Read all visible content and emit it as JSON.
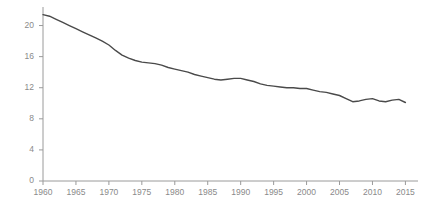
{
  "chart_data": {
    "type": "line",
    "title": "",
    "subtitle": "",
    "xlabel": "",
    "ylabel": "",
    "xlim": [
      1960,
      2016
    ],
    "ylim": [
      0,
      22
    ],
    "grid": false,
    "legend": null,
    "line_color": "#4a4a4a",
    "axis_color": "#9a9a9a",
    "tick_label_color": "#8a8a8a",
    "yticks": [
      0,
      4,
      8,
      12,
      16,
      20
    ],
    "ytick_labels": [
      "0",
      "4",
      "8",
      "12",
      "16",
      "20"
    ],
    "xticks": [
      1960,
      1965,
      1970,
      1975,
      1980,
      1985,
      1990,
      1995,
      2000,
      2005,
      2010,
      2015
    ],
    "xtick_labels": [
      "1960",
      "1965",
      "1970",
      "1975",
      "1980",
      "1985",
      "1990",
      "1995",
      "2000",
      "2005",
      "2010",
      "2015"
    ],
    "series": [
      {
        "name": "rate",
        "x": [
          1960,
          1961,
          1962,
          1963,
          1964,
          1965,
          1966,
          1967,
          1968,
          1969,
          1970,
          1971,
          1972,
          1973,
          1974,
          1975,
          1976,
          1977,
          1978,
          1979,
          1980,
          1981,
          1982,
          1983,
          1984,
          1985,
          1986,
          1987,
          1988,
          1989,
          1990,
          1991,
          1992,
          1993,
          1994,
          1995,
          1996,
          1997,
          1998,
          1999,
          2000,
          2001,
          2002,
          2003,
          2004,
          2005,
          2006,
          2007,
          2008,
          2009,
          2010,
          2011,
          2012,
          2013,
          2014,
          2015
        ],
        "values": [
          21.4,
          21.2,
          20.8,
          20.4,
          20.0,
          19.6,
          19.2,
          18.8,
          18.4,
          18.0,
          17.5,
          16.8,
          16.2,
          15.8,
          15.5,
          15.3,
          15.2,
          15.1,
          14.9,
          14.6,
          14.4,
          14.2,
          14.0,
          13.7,
          13.5,
          13.3,
          13.1,
          13.0,
          13.1,
          13.2,
          13.2,
          13.0,
          12.8,
          12.5,
          12.3,
          12.2,
          12.1,
          12.0,
          12.0,
          11.9,
          11.9,
          11.7,
          11.5,
          11.4,
          11.2,
          11.0,
          10.6,
          10.2,
          10.3,
          10.5,
          10.6,
          10.3,
          10.2,
          10.4,
          10.5,
          10.1
        ]
      }
    ]
  }
}
